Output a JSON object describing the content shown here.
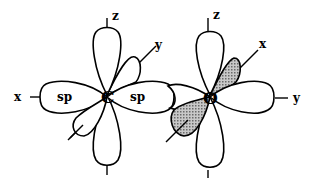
{
  "diagram": {
    "left_atom": {
      "symbol": "C",
      "hybrid_lobe_labels": [
        "sp",
        "sp"
      ],
      "axis_labels": {
        "z": "z",
        "y": "y",
        "x": "x"
      }
    },
    "right_atom": {
      "symbol": "O",
      "axis_labels": {
        "z": "z",
        "x": "x",
        "y": "y"
      }
    },
    "colors": {
      "line": "#000000",
      "shaded_lobe": "#9a9a9a",
      "background": "#ffffff"
    }
  }
}
